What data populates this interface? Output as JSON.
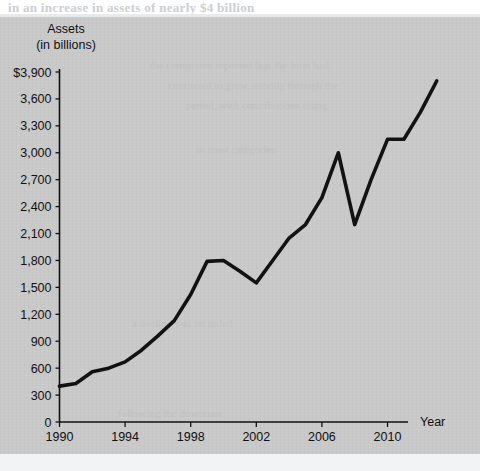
{
  "page": {
    "bleed_text_top": "in  an  increase  in  assets  of  nearly  $4  billion",
    "ghost_texts": [
      "the  committee  reported  that  the  fund  had",
      "continued  to  grow  steadily  through  the",
      "period,  with  contributions  rising",
      "in  most  categories",
      "a  decline  was  recorded",
      "following  the  downturn"
    ]
  },
  "chart_data": {
    "type": "line",
    "title": "Assets",
    "subtitle": "(in billions)",
    "xlabel": "Year",
    "ylabel": "Assets (in billions)",
    "xlim": [
      1990,
      2013
    ],
    "ylim": [
      0,
      3900
    ],
    "ytick_step": 300,
    "grid": false,
    "legend": null,
    "y_axis_prefix": "$",
    "yticks": [
      0,
      300,
      600,
      900,
      1200,
      1500,
      1800,
      2100,
      2400,
      2700,
      3000,
      3300,
      3600,
      3900
    ],
    "ytick_labels": [
      "0",
      "300",
      "600",
      "900",
      "1,200",
      "1,500",
      "1,800",
      "2,100",
      "2,400",
      "2,700",
      "3,000",
      "3,300",
      "3,600",
      "$3,900"
    ],
    "xticks": [
      1990,
      1994,
      1998,
      2002,
      2006,
      2010
    ],
    "xtick_labels": [
      "1990",
      "1994",
      "1998",
      "2002",
      "2006",
      "2010"
    ],
    "x": [
      1990,
      1991,
      1992,
      1993,
      1994,
      1995,
      1996,
      1997,
      1998,
      1999,
      2000,
      2001,
      2002,
      2003,
      2004,
      2005,
      2006,
      2007,
      2008,
      2009,
      2010,
      2011,
      2012,
      2013
    ],
    "values": [
      400,
      430,
      560,
      600,
      670,
      800,
      960,
      1130,
      1420,
      1790,
      1800,
      1680,
      1550,
      1800,
      2050,
      2200,
      2500,
      3000,
      2200,
      2700,
      3150,
      3150,
      3450,
      3800
    ],
    "series": [
      {
        "name": "Assets",
        "color": "#121212",
        "values": [
          400,
          430,
          560,
          600,
          670,
          800,
          960,
          1130,
          1420,
          1790,
          1800,
          1680,
          1550,
          1800,
          2050,
          2200,
          2500,
          3000,
          2200,
          2700,
          3150,
          3150,
          3450,
          3800
        ]
      }
    ],
    "annotations": [
      {
        "label": "peak",
        "x": 2007,
        "y": 3000
      },
      {
        "label": "trough",
        "x": 2008,
        "y": 2200
      },
      {
        "label": "plateau",
        "x": 2010,
        "y": 3150
      }
    ]
  },
  "colors": {
    "panel_background": "#c9c9c9",
    "line": "#121212",
    "axis": "#111111",
    "page_background": "#ffffff",
    "ghost_text": "#bfbfbf"
  }
}
